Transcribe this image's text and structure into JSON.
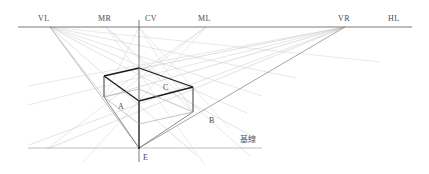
{
  "diagram": {
    "caption_cjk": "基線",
    "colors": {
      "horizon_line": "#6b6b6b",
      "construction_ray": "#c9c9c9",
      "measuring_ray": "#bdbdbd",
      "box_edge_dark": "#1b1b1b",
      "box_edge_mid": "#565656",
      "baseline": "#9a9a9a",
      "axis": "#5a5a5a",
      "label": "#4a4a4a",
      "background": "#ffffff"
    },
    "horizon": {
      "label": "HL",
      "y": 27,
      "x_start": 18,
      "x_end": 412,
      "points": [
        {
          "id": "VL",
          "label": "VL",
          "x": 50,
          "y": 27,
          "label_x": 38,
          "label_y": 21
        },
        {
          "id": "MR",
          "label": "MR",
          "x": 106,
          "y": 27,
          "label_x": 98,
          "label_y": 21
        },
        {
          "id": "CV",
          "label": "CV",
          "x": 139,
          "y": 27,
          "label_x": 145,
          "label_y": 21
        },
        {
          "id": "ML",
          "label": "ML",
          "x": 206,
          "y": 27,
          "label_x": 198,
          "label_y": 21
        },
        {
          "id": "VR",
          "label": "VR",
          "x": 345,
          "y": 27,
          "label_x": 338,
          "label_y": 21
        },
        {
          "id": "HL",
          "label": "HL",
          "x": 412,
          "y": 27,
          "label_x": 388,
          "label_y": 21
        }
      ]
    },
    "center_axis": {
      "label": "CV vertical axis",
      "x": 139,
      "y_top": 20,
      "y_bottom": 162
    },
    "baseline": {
      "label": "基線",
      "y": 148,
      "x_start": 28,
      "x_end": 262,
      "label_x": 240,
      "label_y": 141
    },
    "station_point": {
      "id": "E",
      "label": "E",
      "x": 139,
      "y": 148,
      "label_x": 143,
      "label_y": 160
    },
    "box_labels": [
      {
        "id": "A",
        "label": "A",
        "x": 118,
        "y": 109
      },
      {
        "id": "B",
        "label": "B",
        "x": 209,
        "y": 123
      },
      {
        "id": "C",
        "label": "C",
        "x": 163,
        "y": 90
      }
    ],
    "box_vertices": {
      "top_back": {
        "x": 139,
        "y": 68
      },
      "top_left": {
        "x": 104,
        "y": 76
      },
      "top_right": {
        "x": 193,
        "y": 87
      },
      "top_front": {
        "x": 139,
        "y": 101
      },
      "bot_left": {
        "x": 104,
        "y": 97
      },
      "bot_right": {
        "x": 193,
        "y": 112
      },
      "bot_front": {
        "x": 139,
        "y": 148
      }
    },
    "rays_from_VL": [
      {
        "to_x": 380,
        "to_y": 62
      },
      {
        "to_x": 296,
        "to_y": 78
      },
      {
        "to_x": 262,
        "to_y": 95
      },
      {
        "to_x": 247,
        "to_y": 112
      },
      {
        "to_x": 249,
        "to_y": 134
      },
      {
        "to_x": 193,
        "to_y": 151
      },
      {
        "to_x": 139,
        "to_y": 148
      }
    ],
    "rays_from_VR": [
      {
        "to_x": 28,
        "to_y": 86
      },
      {
        "to_x": 28,
        "to_y": 104
      },
      {
        "to_x": 30,
        "to_y": 145
      },
      {
        "to_x": 47,
        "to_y": 148
      },
      {
        "to_x": 139,
        "to_y": 148
      }
    ],
    "rays_from_ML": [
      {
        "to_x": 47,
        "to_y": 148
      },
      {
        "to_x": 104,
        "to_y": 97
      }
    ],
    "rays_from_MR": [
      {
        "to_x": 249,
        "to_y": 154
      },
      {
        "to_x": 193,
        "to_y": 112
      }
    ],
    "rays_from_CV": [
      {
        "to_x": 104,
        "to_y": 97
      },
      {
        "to_x": 193,
        "to_y": 112
      },
      {
        "to_x": 139,
        "to_y": 148
      }
    ]
  }
}
